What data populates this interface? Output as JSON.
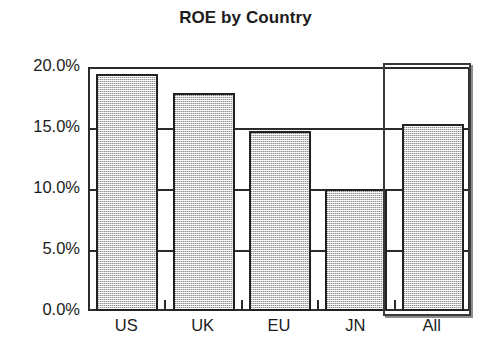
{
  "chart_data": {
    "type": "bar",
    "title": "ROE by Country",
    "xlabel": "",
    "ylabel": "",
    "categories": [
      "US",
      "UK",
      "EU",
      "JN",
      "All"
    ],
    "values": [
      19.4,
      17.9,
      14.75,
      10.0,
      15.3
    ],
    "ylim": [
      0.0,
      20.0
    ],
    "ytick_values": [
      0.0,
      5.0,
      10.0,
      15.0,
      20.0
    ],
    "ytick_labels": [
      "0.0%",
      "5.0%",
      "10.0%",
      "15.0%",
      "20.0%"
    ],
    "grid": true,
    "legend": "none",
    "value_format": "percent",
    "annotations": [
      {
        "name": "all-highlight-box",
        "type": "rectangle-outline",
        "target_category": "All",
        "description": "Rectangular outline drawn around the All column"
      }
    ],
    "bar_style": {
      "fill": "#cfcfcf",
      "pattern": "fine-dither-checker",
      "border": "#212121"
    },
    "colors": {
      "background": "#ffffff",
      "axis": "#2b2b2b",
      "text": "#1c1c1c",
      "bar_fill": "#cfcfcf",
      "bar_border": "#212121",
      "highlight_border": "#3a3a3a"
    }
  }
}
